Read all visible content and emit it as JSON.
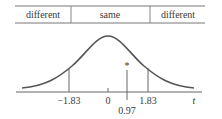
{
  "header": {
    "cells": [
      {
        "label": "different"
      },
      {
        "label": "same"
      },
      {
        "label": "different"
      }
    ]
  },
  "axis": {
    "variable": "t",
    "ticks": [
      {
        "label": "-1.83",
        "value": -1.83
      },
      {
        "label": "0",
        "value": 0
      },
      {
        "label": "1.83",
        "value": 1.83
      }
    ],
    "observed": {
      "label": "0.97",
      "value": 0.97,
      "marker": "*"
    }
  },
  "colors": {
    "curve": "#555555",
    "lines": "#666666",
    "text": "#3a3a3a"
  }
}
